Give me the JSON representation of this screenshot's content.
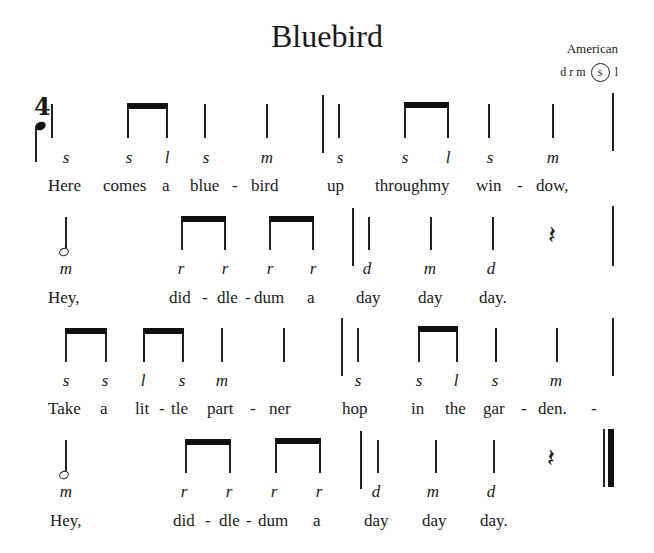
{
  "title": "Bluebird",
  "origin": "American",
  "tonal_center": {
    "prefix": "d r m",
    "circled": "s",
    "suffix": "l"
  },
  "time_signature": {
    "top": "4",
    "bottom_symbol": "quarter-note"
  },
  "lines": [
    {
      "solfege": [
        "s",
        "s",
        "l",
        "s",
        "m",
        "s",
        "s",
        "l",
        "s",
        "m"
      ],
      "lyrics": [
        "Here",
        "comes",
        "a",
        "blue",
        "-",
        "bird",
        "up",
        "throughmy",
        "win",
        "-",
        "dow,"
      ]
    },
    {
      "solfege": [
        "m",
        "r",
        "r",
        "r",
        "r",
        "d",
        "m",
        "d"
      ],
      "lyrics": [
        "Hey,",
        "did",
        "-",
        "dle",
        "-",
        "dum",
        "a",
        "day",
        "day",
        "day."
      ]
    },
    {
      "solfege": [
        "s",
        "s",
        "l",
        "s",
        "m",
        "s",
        "s",
        "l",
        "s",
        "m"
      ],
      "lyrics": [
        "Take",
        "a",
        "lit",
        "-",
        "tle",
        "part",
        "-",
        "ner",
        "hop",
        "in",
        "the",
        "gar",
        "-",
        "den.",
        "-"
      ]
    },
    {
      "solfege": [
        "m",
        "r",
        "r",
        "r",
        "r",
        "d",
        "m",
        "d"
      ],
      "lyrics": [
        "Hey,",
        "did",
        "-",
        "dle",
        "-",
        "dum",
        "a",
        "day",
        "day",
        "day."
      ]
    }
  ]
}
